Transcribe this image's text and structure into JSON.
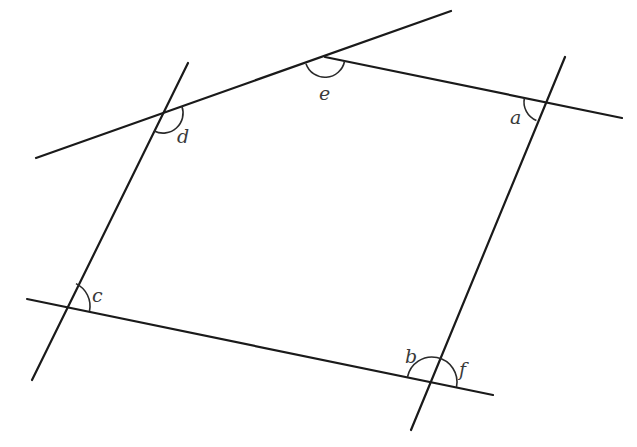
{
  "diagram": {
    "type": "geometry",
    "colors": {
      "line": "#1a1a1a",
      "arc": "#2a2a2a",
      "label": "#3a3a3a",
      "background": "#ffffff"
    },
    "lines": [
      {
        "id": "top-left-line",
        "x1": 36,
        "y1": 158,
        "x2": 451,
        "y2": 11
      },
      {
        "id": "top-right-line",
        "x1": 325,
        "y1": 57,
        "x2": 622,
        "y2": 118
      },
      {
        "id": "left-line",
        "x1": 188,
        "y1": 63,
        "x2": 32,
        "y2": 380
      },
      {
        "id": "right-line",
        "x1": 565,
        "y1": 57,
        "x2": 411,
        "y2": 430
      },
      {
        "id": "bottom-line",
        "x1": 27,
        "y1": 299,
        "x2": 493,
        "y2": 395
      }
    ],
    "vertices": {
      "a": {
        "x": 544,
        "y": 102
      },
      "b_f": {
        "x": 432,
        "y": 382
      },
      "c": {
        "x": 65,
        "y": 306
      },
      "d": {
        "x": 163,
        "y": 113
      },
      "e": {
        "x": 325,
        "y": 57
      }
    },
    "angles": [
      {
        "name": "a",
        "label": "a",
        "vertex": "a"
      },
      {
        "name": "b",
        "label": "b",
        "vertex": "b_f"
      },
      {
        "name": "c",
        "label": "c",
        "vertex": "c"
      },
      {
        "name": "d",
        "label": "d",
        "vertex": "d"
      },
      {
        "name": "e",
        "label": "e",
        "vertex": "e"
      },
      {
        "name": "f",
        "label": "f",
        "vertex": "b_f"
      }
    ]
  }
}
